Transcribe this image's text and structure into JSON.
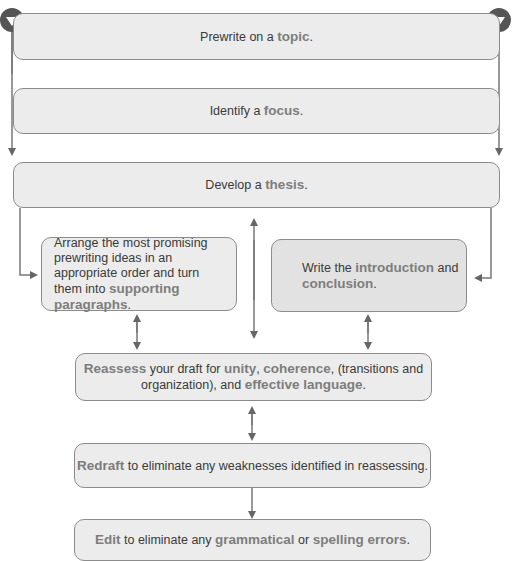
{
  "diagram": {
    "steps": [
      {
        "id": "prewrite",
        "parts": [
          {
            "t": "Prewrite on a "
          },
          {
            "t": "topic",
            "hl": true
          },
          {
            "t": "."
          }
        ]
      },
      {
        "id": "focus",
        "parts": [
          {
            "t": "Identify a "
          },
          {
            "t": "focus",
            "hl": true
          },
          {
            "t": "."
          }
        ]
      },
      {
        "id": "thesis",
        "parts": [
          {
            "t": "Develop a "
          },
          {
            "t": "thesis",
            "hl": true
          },
          {
            "t": "."
          }
        ]
      },
      {
        "id": "supporting",
        "parts": [
          {
            "t": "Arrange the most promising prewriting ideas in an appropriate order and turn them into "
          },
          {
            "t": "supporting paragraphs",
            "hl": true
          },
          {
            "t": "."
          }
        ]
      },
      {
        "id": "intro",
        "parts": [
          {
            "t": "Write the "
          },
          {
            "t": "introduction",
            "hl": true
          },
          {
            "t": " and "
          },
          {
            "t": "conclusion",
            "hl": true
          },
          {
            "t": "."
          }
        ]
      },
      {
        "id": "reassess",
        "parts": [
          {
            "t": "Reassess",
            "hl": true
          },
          {
            "t": " your draft for "
          },
          {
            "t": "unity",
            "hl": true
          },
          {
            "t": ", "
          },
          {
            "t": "coherence",
            "hl": true
          },
          {
            "t": ", (transitions and organization), and "
          },
          {
            "t": "effective language",
            "hl": true
          },
          {
            "t": "."
          }
        ]
      },
      {
        "id": "redraft",
        "parts": [
          {
            "t": "Redraft",
            "hl": true
          },
          {
            "t": " to eliminate any weaknesses identified in reassessing."
          }
        ]
      },
      {
        "id": "edit",
        "parts": [
          {
            "t": "Edit",
            "hl": true
          },
          {
            "t": " to eliminate any "
          },
          {
            "t": "grammatical",
            "hl": true
          },
          {
            "t": " or "
          },
          {
            "t": "spelling errors",
            "hl": true
          },
          {
            "t": "."
          }
        ]
      }
    ]
  },
  "colors": {
    "box_fill": "#ececec",
    "border": "#8c8c8c",
    "highlight": "#7d7d7d",
    "arrow": "#666666"
  }
}
